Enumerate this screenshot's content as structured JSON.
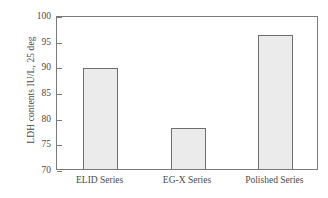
{
  "chart_data": {
    "type": "bar",
    "title": "",
    "xlabel": "",
    "ylabel": "LDH contents IU/L, 25 deg",
    "categories": [
      "ELID Series",
      "EG-X Series",
      "Polished Series"
    ],
    "values": [
      89.6,
      78.0,
      96.2
    ],
    "ylim": [
      70,
      100
    ],
    "yticks": [
      70,
      75,
      80,
      85,
      90,
      95,
      100
    ],
    "ytick_labels": [
      "70",
      "75",
      "80",
      "85",
      "90",
      "95",
      "100"
    ],
    "grid": false,
    "legend": "none",
    "colors": {
      "bar_fill": "#ebebeb",
      "bar_edge": "#6e6e6e",
      "axis": "#7a7a7a",
      "text": "#4a4a4a",
      "background": "#ffffff"
    }
  }
}
